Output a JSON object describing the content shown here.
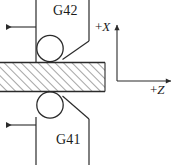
{
  "diagram": {
    "type": "machining-tool-offset-diagram",
    "stroke_color": "#2b2b2b",
    "hatch_color": "#5a5a5a",
    "background_color": "#ffffff",
    "labels": {
      "upper_tool": "G42",
      "lower_tool": "G41",
      "axis_x": "+X",
      "axis_x_sign": "+",
      "axis_x_letter": "X",
      "axis_z": "+Z",
      "axis_z_sign": "+",
      "axis_z_letter": "Z"
    },
    "workpiece": {
      "name": "hatched-workpiece",
      "fill": "diagonal-hatch",
      "x": 0,
      "y": 62,
      "width": 105,
      "height": 30
    },
    "upper_tool": {
      "name": "upper-tool",
      "circle_center_x": 50,
      "circle_center_y": 47,
      "circle_radius": 13,
      "feed_direction": "left"
    },
    "lower_tool": {
      "name": "lower-tool",
      "circle_center_x": 50,
      "circle_center_y": 107,
      "circle_radius": 13,
      "feed_direction": "left"
    },
    "axes": {
      "name": "coordinate-axes",
      "origin_x": 117,
      "origin_y": 81,
      "x_axis_direction": "up",
      "z_axis_direction": "right"
    },
    "feed_arrows": [
      {
        "name": "upper-feed-arrow",
        "direction": "left",
        "y": 27,
        "from_x": 36,
        "to_x": 5
      },
      {
        "name": "lower-feed-arrow",
        "direction": "left",
        "y": 125,
        "from_x": 36,
        "to_x": 5
      }
    ]
  }
}
